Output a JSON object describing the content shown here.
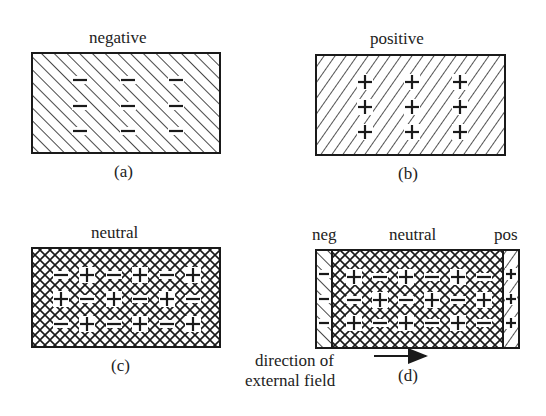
{
  "panels": {
    "a": {
      "title": "negative",
      "caption": "(a)",
      "charge": "-",
      "hatch": "backslash",
      "charges": [
        [
          "-",
          "-",
          "-"
        ],
        [
          "-",
          "-",
          "-"
        ],
        [
          "-",
          "-",
          "-"
        ]
      ]
    },
    "b": {
      "title": "positive",
      "caption": "(b)",
      "charge": "+",
      "hatch": "slash",
      "charges": [
        [
          "+",
          "+",
          "+"
        ],
        [
          "+",
          "+",
          "+"
        ],
        [
          "+",
          "+",
          "+"
        ]
      ]
    },
    "c": {
      "title": "neutral",
      "caption": "(c)",
      "hatch": "crosshatch",
      "charges": [
        [
          "-",
          "+",
          "-",
          "+",
          "-",
          "+"
        ],
        [
          "+",
          "-",
          "+",
          "-",
          "+",
          "-"
        ],
        [
          "-",
          "+",
          "-",
          "+",
          "-",
          "+"
        ]
      ]
    },
    "d": {
      "title_left": "neg",
      "title_center": "neutral",
      "title_right": "pos",
      "caption": "(d)",
      "left_strip_charges": [
        "-",
        "-",
        "-"
      ],
      "center_charges": [
        [
          "+",
          "-",
          "+",
          "-",
          "+",
          "-"
        ],
        [
          "-",
          "+",
          "-",
          "+",
          "-",
          "+"
        ],
        [
          "+",
          "-",
          "+",
          "-",
          "+",
          "-"
        ]
      ],
      "right_strip_charges": [
        "+",
        "+",
        "+"
      ],
      "arrow_label_line1": "direction of",
      "arrow_label_line2": "external field"
    }
  },
  "colors": {
    "ink": "#1a1a1a",
    "background": "#ffffff"
  }
}
